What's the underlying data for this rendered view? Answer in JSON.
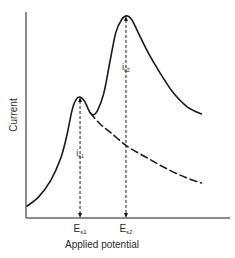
{
  "chart_data": {
    "type": "line",
    "title": "",
    "xlabel": "Applied potential",
    "ylabel": "Current",
    "xlim": [
      0,
      1
    ],
    "ylim": [
      0,
      1
    ],
    "grid": false,
    "legend": "none",
    "series": [
      {
        "name": "combined-wave",
        "style": "solid",
        "x": [
          0.005,
          0.06,
          0.12,
          0.17,
          0.2,
          0.225,
          0.245,
          0.265,
          0.285,
          0.3,
          0.315,
          0.33,
          0.35,
          0.38,
          0.41,
          0.44,
          0.47,
          0.495,
          0.52,
          0.55,
          0.6,
          0.66,
          0.72,
          0.79,
          0.86
        ],
        "y": [
          0.058,
          0.1,
          0.18,
          0.29,
          0.4,
          0.52,
          0.575,
          0.587,
          0.57,
          0.54,
          0.51,
          0.5,
          0.52,
          0.6,
          0.75,
          0.9,
          0.965,
          0.981,
          0.96,
          0.9,
          0.8,
          0.7,
          0.61,
          0.54,
          0.505
        ]
      },
      {
        "name": "first-wave-decay",
        "style": "dashed",
        "x": [
          0.315,
          0.36,
          0.42,
          0.5,
          0.58,
          0.66,
          0.74,
          0.8,
          0.86
        ],
        "y": [
          0.51,
          0.46,
          0.41,
          0.345,
          0.3,
          0.255,
          0.215,
          0.19,
          0.17
        ]
      }
    ],
    "annotations": [
      {
        "label": "i",
        "sub": "s1",
        "x": 0.265,
        "y_from": 0,
        "y_to": 0.587,
        "label_y": 0.3
      },
      {
        "label": "i",
        "sub": "s2",
        "x": 0.49,
        "y_from": 0,
        "y_to": 0.981,
        "label_y": 0.72
      }
    ],
    "x_ticks": [
      {
        "label": "E",
        "sub": "s1",
        "x": 0.265
      },
      {
        "label": "E",
        "sub": "s2",
        "x": 0.49
      }
    ]
  }
}
